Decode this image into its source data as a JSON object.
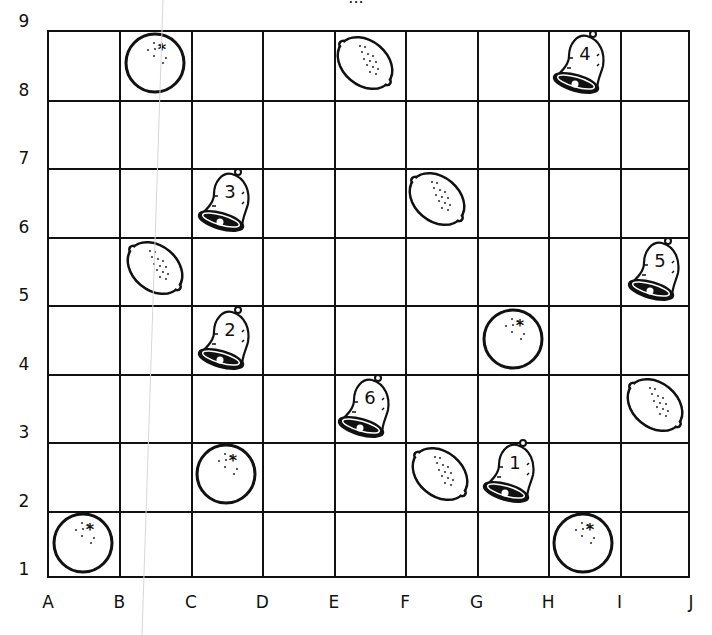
{
  "title": "...",
  "grid": {
    "columns": [
      "A",
      "B",
      "C",
      "D",
      "E",
      "F",
      "G",
      "H",
      "I",
      "J"
    ],
    "rows": [
      "1",
      "2",
      "3",
      "4",
      "5",
      "6",
      "7",
      "8",
      "9"
    ],
    "line_color": "#111111",
    "background": "#ffffff"
  },
  "items": [
    {
      "type": "orange",
      "col": "B",
      "row": "8",
      "cx": 155,
      "cy": 63
    },
    {
      "type": "lemon",
      "col": "E",
      "row": "8",
      "cx": 365,
      "cy": 63
    },
    {
      "type": "bell",
      "label": "4",
      "col": "H",
      "row": "8",
      "cx": 580,
      "cy": 63
    },
    {
      "type": "bell",
      "label": "3",
      "col": "C",
      "row": "6",
      "cx": 225,
      "cy": 201
    },
    {
      "type": "lemon",
      "col": "F",
      "row": "6",
      "cx": 437,
      "cy": 199
    },
    {
      "type": "lemon",
      "col": "B",
      "row": "5",
      "cx": 155,
      "cy": 268
    },
    {
      "type": "bell",
      "label": "5",
      "col": "I",
      "row": "5",
      "cx": 655,
      "cy": 270
    },
    {
      "type": "bell",
      "label": "2",
      "col": "C",
      "row": "4",
      "cx": 225,
      "cy": 339
    },
    {
      "type": "orange",
      "col": "G",
      "row": "4",
      "cx": 513,
      "cy": 339
    },
    {
      "type": "lemon",
      "col": "I",
      "row": "3",
      "cx": 655,
      "cy": 405
    },
    {
      "type": "bell",
      "label": "6",
      "col": "E",
      "row": "3",
      "cx": 365,
      "cy": 407
    },
    {
      "type": "orange",
      "col": "C",
      "row": "2",
      "cx": 226,
      "cy": 474
    },
    {
      "type": "lemon",
      "col": "F",
      "row": "2",
      "cx": 440,
      "cy": 474
    },
    {
      "type": "bell",
      "label": "1",
      "col": "G",
      "row": "2",
      "cx": 510,
      "cy": 472
    },
    {
      "type": "orange",
      "col": "A",
      "row": "1",
      "cx": 83,
      "cy": 543
    },
    {
      "type": "orange",
      "col": "H",
      "row": "1",
      "cx": 583,
      "cy": 543
    }
  ]
}
